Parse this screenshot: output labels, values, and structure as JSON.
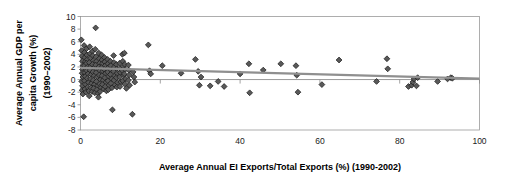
{
  "chart_data": {
    "type": "scatter",
    "title": "",
    "xlabel": "Average Annual EI Exports/Total Exports (%) (1990-2002)",
    "ylabel_line1": "Average Annual GDP per",
    "ylabel_line2": "capita Growth (%)",
    "ylabel_line3": "(1990–2002)",
    "xlim": [
      0,
      100
    ],
    "ylim": [
      -8,
      10
    ],
    "xticks": [
      0,
      20,
      40,
      60,
      80,
      100
    ],
    "yticks": [
      10,
      8,
      6,
      4,
      2,
      0,
      -2,
      -4,
      -6,
      -8
    ],
    "xtick_labels": [
      "0",
      "20",
      "40",
      "60",
      "80",
      "100"
    ],
    "ytick_labels": [
      "10",
      "8",
      "6",
      "4",
      "2",
      "0",
      "-2",
      "-4",
      "-6",
      "-8"
    ],
    "grid": false,
    "legend": "none",
    "marker_shape": "diamond",
    "marker_color": "#595959",
    "marker_edge_color": "#1c1c1c",
    "trendline": {
      "present": true,
      "color": "#8f8f8f",
      "x_start": 0,
      "y_start": 1.85,
      "x_end": 100,
      "y_end": 0.15
    },
    "zero_reference_line": true,
    "points": [
      [
        0.2,
        6.3
      ],
      [
        0.3,
        4.6
      ],
      [
        0.4,
        3.7
      ],
      [
        0.5,
        2.9
      ],
      [
        0.6,
        2.2
      ],
      [
        0.5,
        1.6
      ],
      [
        0.4,
        1.0
      ],
      [
        0.6,
        0.4
      ],
      [
        0.3,
        -0.3
      ],
      [
        0.5,
        -1.0
      ],
      [
        0.4,
        -1.7
      ],
      [
        0.6,
        -2.3
      ],
      [
        0.8,
        -5.9
      ],
      [
        0.9,
        5.4
      ],
      [
        1.0,
        4.3
      ],
      [
        1.1,
        3.5
      ],
      [
        1.2,
        2.8
      ],
      [
        1.0,
        2.2
      ],
      [
        1.3,
        1.7
      ],
      [
        1.1,
        1.1
      ],
      [
        1.2,
        0.5
      ],
      [
        1.0,
        -0.2
      ],
      [
        1.3,
        -0.8
      ],
      [
        1.1,
        -1.5
      ],
      [
        1.4,
        -2.0
      ],
      [
        1.5,
        4.9
      ],
      [
        1.6,
        3.9
      ],
      [
        1.7,
        3.2
      ],
      [
        1.5,
        2.6
      ],
      [
        1.8,
        2.0
      ],
      [
        1.6,
        1.4
      ],
      [
        1.9,
        0.9
      ],
      [
        1.7,
        0.2
      ],
      [
        2.0,
        -0.5
      ],
      [
        1.8,
        -1.2
      ],
      [
        2.1,
        -1.8
      ],
      [
        2.2,
        -2.6
      ],
      [
        2.3,
        5.2
      ],
      [
        2.4,
        4.1
      ],
      [
        2.5,
        3.4
      ],
      [
        2.2,
        2.7
      ],
      [
        2.6,
        2.1
      ],
      [
        2.4,
        1.5
      ],
      [
        2.7,
        0.8
      ],
      [
        2.5,
        0.1
      ],
      [
        2.8,
        -0.6
      ],
      [
        2.6,
        -1.3
      ],
      [
        2.9,
        -1.9
      ],
      [
        3.0,
        4.5
      ],
      [
        3.1,
        3.8
      ],
      [
        3.2,
        3.0
      ],
      [
        3.0,
        2.4
      ],
      [
        3.3,
        1.8
      ],
      [
        3.1,
        1.2
      ],
      [
        3.4,
        0.6
      ],
      [
        3.2,
        -0.1
      ],
      [
        3.5,
        -0.8
      ],
      [
        3.3,
        -1.4
      ],
      [
        3.6,
        -2.1
      ],
      [
        3.8,
        8.2
      ],
      [
        3.7,
        4.8
      ],
      [
        3.9,
        3.6
      ],
      [
        4.0,
        2.9
      ],
      [
        3.8,
        2.3
      ],
      [
        4.1,
        1.7
      ],
      [
        3.9,
        1.1
      ],
      [
        4.2,
        0.4
      ],
      [
        4.0,
        -0.3
      ],
      [
        4.3,
        -1.0
      ],
      [
        4.1,
        -1.6
      ],
      [
        4.4,
        -2.2
      ],
      [
        4.5,
        -2.8
      ],
      [
        4.6,
        4.2
      ],
      [
        4.7,
        3.3
      ],
      [
        4.8,
        2.6
      ],
      [
        4.6,
        2.0
      ],
      [
        4.9,
        1.4
      ],
      [
        4.7,
        0.7
      ],
      [
        5.0,
        0.0
      ],
      [
        4.8,
        -0.7
      ],
      [
        5.1,
        -1.3
      ],
      [
        4.9,
        -1.9
      ],
      [
        5.3,
        3.9
      ],
      [
        5.4,
        3.1
      ],
      [
        5.5,
        2.5
      ],
      [
        5.3,
        1.9
      ],
      [
        5.6,
        1.3
      ],
      [
        5.4,
        0.6
      ],
      [
        5.7,
        -0.1
      ],
      [
        5.5,
        -0.8
      ],
      [
        5.8,
        -1.5
      ],
      [
        6.0,
        3.5
      ],
      [
        6.1,
        2.8
      ],
      [
        6.2,
        2.2
      ],
      [
        6.0,
        1.6
      ],
      [
        6.3,
        1.0
      ],
      [
        6.1,
        0.3
      ],
      [
        6.4,
        -0.4
      ],
      [
        6.2,
        -1.1
      ],
      [
        6.5,
        -1.8
      ],
      [
        6.8,
        3.2
      ],
      [
        6.9,
        2.5
      ],
      [
        7.0,
        1.9
      ],
      [
        6.8,
        1.2
      ],
      [
        7.1,
        0.5
      ],
      [
        6.9,
        -0.2
      ],
      [
        7.2,
        -0.9
      ],
      [
        7.0,
        -1.6
      ],
      [
        7.5,
        2.9
      ],
      [
        7.6,
        2.2
      ],
      [
        7.7,
        1.5
      ],
      [
        7.5,
        0.8
      ],
      [
        7.8,
        0.1
      ],
      [
        7.6,
        -0.6
      ],
      [
        7.9,
        -1.3
      ],
      [
        8.0,
        -4.8
      ],
      [
        8.3,
        3.8
      ],
      [
        8.4,
        2.7
      ],
      [
        8.5,
        2.0
      ],
      [
        8.3,
        1.3
      ],
      [
        8.6,
        0.6
      ],
      [
        8.4,
        -0.1
      ],
      [
        8.7,
        -0.9
      ],
      [
        9.0,
        2.4
      ],
      [
        9.1,
        1.7
      ],
      [
        9.2,
        1.0
      ],
      [
        9.0,
        0.3
      ],
      [
        9.3,
        -0.5
      ],
      [
        9.1,
        -1.2
      ],
      [
        9.8,
        2.6
      ],
      [
        9.9,
        1.8
      ],
      [
        10.0,
        1.1
      ],
      [
        9.8,
        0.4
      ],
      [
        10.1,
        -0.4
      ],
      [
        9.9,
        -1.1
      ],
      [
        10.5,
        4.0
      ],
      [
        10.6,
        2.9
      ],
      [
        10.7,
        2.1
      ],
      [
        10.5,
        1.4
      ],
      [
        10.8,
        0.7
      ],
      [
        10.6,
        -0.2
      ],
      [
        11.0,
        4.2
      ],
      [
        11.1,
        2.4
      ],
      [
        11.2,
        1.6
      ],
      [
        11.0,
        0.9
      ],
      [
        11.3,
        0.1
      ],
      [
        11.1,
        -0.7
      ],
      [
        11.5,
        -1.4
      ],
      [
        12.0,
        2.3
      ],
      [
        12.1,
        1.5
      ],
      [
        12.2,
        0.7
      ],
      [
        12.0,
        -0.1
      ],
      [
        12.3,
        -0.9
      ],
      [
        13.0,
        -5.5
      ],
      [
        13.2,
        1.2
      ],
      [
        13.4,
        0.4
      ],
      [
        13.6,
        -0.4
      ],
      [
        17.0,
        5.5
      ],
      [
        17.3,
        1.4
      ],
      [
        17.6,
        0.9
      ],
      [
        20.5,
        2.2
      ],
      [
        25.2,
        1.0
      ],
      [
        28.8,
        3.2
      ],
      [
        29.5,
        1.3
      ],
      [
        29.8,
        -0.9
      ],
      [
        30.2,
        0.4
      ],
      [
        32.5,
        -1.0
      ],
      [
        34.5,
        -0.3
      ],
      [
        36.0,
        -1.1
      ],
      [
        40.0,
        0.9
      ],
      [
        42.2,
        2.5
      ],
      [
        42.4,
        -2.1
      ],
      [
        45.8,
        1.5
      ],
      [
        50.2,
        2.5
      ],
      [
        54.0,
        2.2
      ],
      [
        54.2,
        0.7
      ],
      [
        54.5,
        -2.0
      ],
      [
        60.5,
        -0.8
      ],
      [
        64.8,
        3.1
      ],
      [
        74.2,
        -0.3
      ],
      [
        76.8,
        3.3
      ],
      [
        77.0,
        1.7
      ],
      [
        82.2,
        -1.1
      ],
      [
        83.0,
        -0.9
      ],
      [
        83.3,
        -0.4
      ],
      [
        83.6,
        0.1
      ],
      [
        84.2,
        -1.0
      ],
      [
        84.5,
        0.3
      ],
      [
        89.5,
        -0.3
      ],
      [
        92.0,
        0.1
      ],
      [
        92.8,
        0.3
      ],
      [
        93.2,
        0.2
      ]
    ]
  }
}
